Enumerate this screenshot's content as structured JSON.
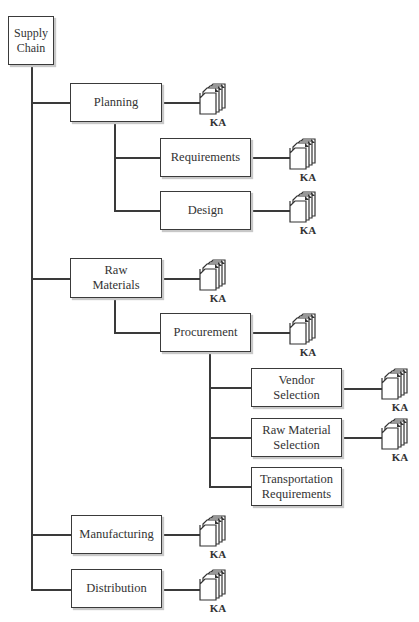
{
  "diagram": {
    "root": "Supply Chain",
    "ka_label": "KA",
    "nodes": {
      "supply_chain": "Supply\nChain",
      "planning": "Planning",
      "requirements": "Requirements",
      "design": "Design",
      "raw_materials": "Raw\nMaterials",
      "procurement": "Procurement",
      "vendor_selection": "Vendor\nSelection",
      "raw_material_selection": "Raw Material\nSelection",
      "transportation_requirements": "Transportation\nRequirements",
      "manufacturing": "Manufacturing",
      "distribution": "Distribution"
    },
    "tree": [
      {
        "id": "planning",
        "ka": true,
        "children": [
          {
            "id": "requirements",
            "ka": true
          },
          {
            "id": "design",
            "ka": true
          }
        ]
      },
      {
        "id": "raw_materials",
        "ka": true,
        "children": [
          {
            "id": "procurement",
            "ka": true,
            "children": [
              {
                "id": "vendor_selection",
                "ka": true
              },
              {
                "id": "raw_material_selection",
                "ka": true
              },
              {
                "id": "transportation_requirements",
                "ka": false
              }
            ]
          }
        ]
      },
      {
        "id": "manufacturing",
        "ka": true
      },
      {
        "id": "distribution",
        "ka": true
      }
    ]
  }
}
